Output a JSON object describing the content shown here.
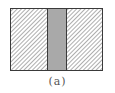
{
  "figure": {
    "caption": "(a)",
    "colors": {
      "border": "#3a3a3a",
      "hatch": "#6a6a6a",
      "center_fill": "#a9a9a9",
      "background": "#ffffff"
    },
    "regions": [
      {
        "name": "left-hatched-region",
        "pattern": "diagonal-hatch"
      },
      {
        "name": "center-gray-band",
        "pattern": "solid-gray"
      },
      {
        "name": "right-hatched-region",
        "pattern": "diagonal-hatch"
      }
    ]
  }
}
